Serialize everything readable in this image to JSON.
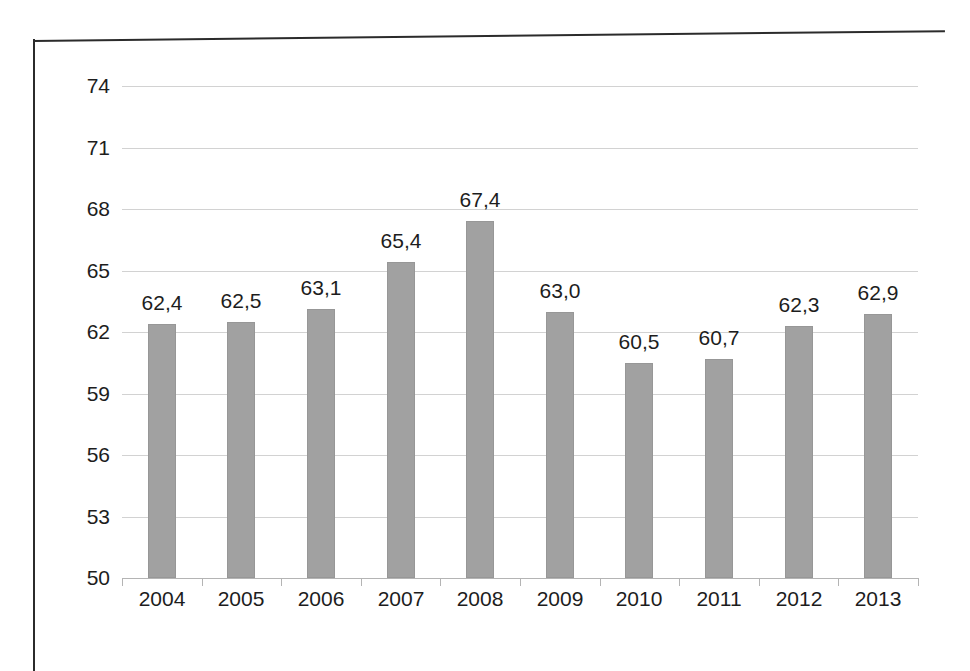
{
  "chart_data": {
    "type": "bar",
    "title": "",
    "subtitle": "",
    "xlabel": "",
    "ylabel": "",
    "categories": [
      "2004",
      "2005",
      "2006",
      "2007",
      "2008",
      "2009",
      "2010",
      "2011",
      "2012",
      "2013"
    ],
    "values": [
      62.4,
      62.5,
      63.1,
      65.4,
      67.4,
      63.0,
      60.5,
      60.7,
      62.3,
      62.9
    ],
    "value_labels": [
      "62,4",
      "62,5",
      "63,1",
      "65,4",
      "67,4",
      "63,0",
      "60,5",
      "60,7",
      "62,3",
      "62,9"
    ],
    "ylim": [
      50,
      74
    ],
    "ytick_values": [
      50,
      53,
      56,
      59,
      62,
      65,
      68,
      71,
      74
    ],
    "ytick_labels": [
      "50",
      "53",
      "56",
      "59",
      "62",
      "65",
      "68",
      "71",
      "74"
    ],
    "ystep": 3,
    "grid": true,
    "grid_axis": "y",
    "legend": false,
    "legend_position": "none",
    "decimal_separator": ",",
    "series": [
      {
        "name": "",
        "values": [
          62.4,
          62.5,
          63.1,
          65.4,
          67.4,
          63.0,
          60.5,
          60.7,
          62.3,
          62.9
        ],
        "color": "#a1a1a1"
      }
    ],
    "colors": {
      "bar_fill": "#a1a1a1",
      "bar_stroke": "#979797",
      "gridline": "#d2d2d2",
      "axis": "#b4b4b4",
      "text": "#1d1d1d",
      "frame": "#2b2b2b",
      "background": "#ffffff"
    }
  }
}
